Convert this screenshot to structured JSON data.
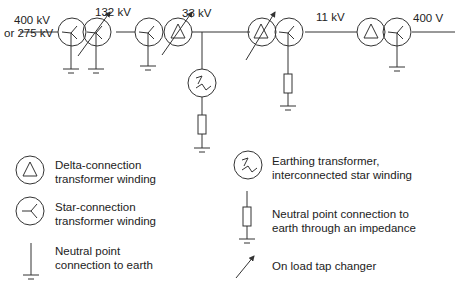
{
  "diagram": {
    "voltage_labels": {
      "v400_275_line1": "400 kV",
      "v400_275_line2": "or 275 kV",
      "v132": "132 kV",
      "v33": "33 kV",
      "v11": "11 kV",
      "v400v": "400 V"
    },
    "stroke_color": "#333333"
  },
  "legend": {
    "delta": {
      "line1": "Delta-connection",
      "line2": "transformer winding"
    },
    "star": {
      "line1": "Star-connection",
      "line2": "transformer winding"
    },
    "earth": {
      "line1": "Neutral point",
      "line2": "connection to earth"
    },
    "earthing_transformer": {
      "line1": "Earthing transformer,",
      "line2": "interconnected star winding"
    },
    "impedance": {
      "line1": "Neutral point connection to",
      "line2": "earth through an impedance"
    },
    "tap_changer": {
      "line1": "On load tap changer"
    }
  }
}
